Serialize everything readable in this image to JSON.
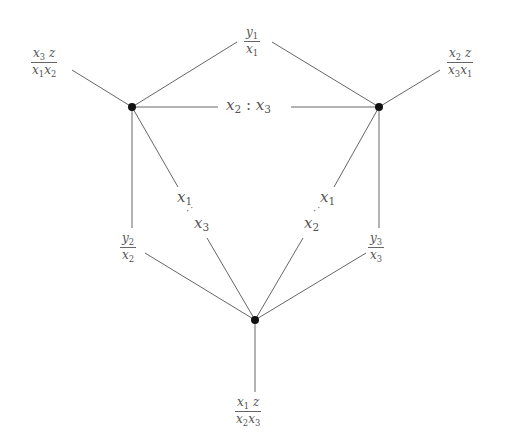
{
  "diagram": {
    "type": "graph",
    "nodes": [
      {
        "id": "left",
        "x": 132,
        "y": 107
      },
      {
        "id": "right",
        "x": 379,
        "y": 107
      },
      {
        "id": "bottom",
        "x": 255,
        "y": 320
      }
    ],
    "labels": {
      "top": {
        "num": "y",
        "num_sub": "1",
        "den": "x",
        "den_sub": "1"
      },
      "top_left": {
        "num": "x",
        "num_sub": "3",
        "num_extra": " z",
        "den": "x",
        "den_sub": "1",
        "den2": "x",
        "den2_sub": "2"
      },
      "top_right": {
        "num": "x",
        "num_sub": "2",
        "num_extra": " z",
        "den": "x",
        "den_sub": "3",
        "den2": "x",
        "den2_sub": "1"
      },
      "middle_edge": {
        "a": "x",
        "a_sub": "2",
        "sep": " : ",
        "b": "x",
        "b_sub": "3"
      },
      "left_vertical": {
        "num": "y",
        "num_sub": "2",
        "den": "x",
        "den_sub": "2"
      },
      "right_vertical": {
        "num": "y",
        "num_sub": "3",
        "den": "x",
        "den_sub": "3"
      },
      "left_diag": {
        "a": "x",
        "a_sub": "1",
        "dots": "·˙",
        "b": "x",
        "b_sub": "3"
      },
      "right_diag": {
        "a": "x",
        "a_sub": "1",
        "dots": "·˙",
        "b": "x",
        "b_sub": "2"
      },
      "bottom": {
        "num": "x",
        "num_sub": "1",
        "num_extra": " z",
        "den": "x",
        "den_sub": "2",
        "den2": "x",
        "den2_sub": "3"
      }
    },
    "colors": {
      "line": "#666666",
      "node": "#111111",
      "text": "#555555"
    }
  }
}
